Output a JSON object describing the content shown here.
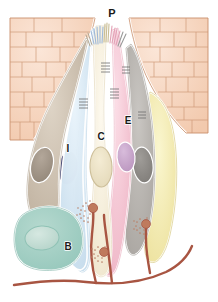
{
  "figure": {
    "background_color": "#ffffff",
    "width": 218,
    "height": 302
  },
  "labels": [
    {
      "id": "P",
      "text": "P",
      "x": 112,
      "y": 17,
      "font_size": 11,
      "meaning": "taste-pore"
    },
    {
      "id": "I",
      "text": "I",
      "x": 68,
      "y": 152,
      "font_size": 10,
      "meaning": "type-I-cell"
    },
    {
      "id": "C",
      "text": "C",
      "x": 101,
      "y": 140,
      "font_size": 10,
      "meaning": "type-II-receptor-cell"
    },
    {
      "id": "E",
      "text": "E",
      "x": 128,
      "y": 124,
      "font_size": 10,
      "meaning": "type-III-presynaptic-cell"
    },
    {
      "id": "B",
      "text": "B",
      "x": 68,
      "y": 250,
      "font_size": 10,
      "meaning": "basal-cell"
    }
  ],
  "palette": {
    "epithelium_fill": "#f6d2bb",
    "epithelium_fill_light": "#fbe4d6",
    "epithelium_stroke": "#c98f6b",
    "outline_white": "#ffffff",
    "cell_tan": "#cfc3b2",
    "cell_tan_dark": "#b7a997",
    "cell_blue": "#d7e7f2",
    "cell_blue_dark": "#bcd6e8",
    "cell_cream": "#f7f1de",
    "cell_cream_dark": "#ece3c9",
    "cell_pink": "#f6ccd7",
    "cell_pink_dark": "#eeb3c4",
    "cell_gray": "#b9b6b2",
    "cell_gray_dark": "#a19d98",
    "cell_yellow": "#f5eeb8",
    "cell_yellow_dark": "#e9dd96",
    "cell_teal": "#9fcdc2",
    "cell_teal_dark": "#8cbfb2",
    "nucleus_tan": "#a39688",
    "nucleus_blue": "#40416b",
    "nucleus_cream": "#ece3c4",
    "nucleus_violet": "#c9a8cc",
    "nucleus_gray": "#8e8b87",
    "nucleus_teal": "#c3dcd3",
    "nerve_fiber": "#a85542",
    "nerve_bouton": "#bf7a5d",
    "junction_line": "#6d6d6d",
    "microvilli_blue": "#9fb8d8",
    "microvilli_pink": "#e2a2b6",
    "microvilli_gray": "#9a9a9a",
    "microvilli_cream": "#d9cfa8",
    "label_color": "#1a1a1a"
  },
  "regions": {
    "epithelium_left": {
      "name": "stratified-squamous-epithelium-left"
    },
    "epithelium_right": {
      "name": "stratified-squamous-epithelium-right"
    },
    "taste_pore": {
      "name": "taste-pore-opening"
    },
    "nerve_plexus": {
      "name": "afferent-nerve-fiber-plexus"
    }
  },
  "cells": [
    {
      "id": "cell-tan-left",
      "label": "",
      "fill": "#cfc3b2",
      "nucleus": "#a39688"
    },
    {
      "id": "cell-blue-I",
      "label": "I",
      "fill": "#d7e7f2",
      "nucleus": "#40416b"
    },
    {
      "id": "cell-cream-C",
      "label": "C",
      "fill": "#f7f1de",
      "nucleus": "#ece3c4"
    },
    {
      "id": "cell-pink-E",
      "label": "E",
      "fill": "#f6ccd7",
      "nucleus": "#c9a8cc"
    },
    {
      "id": "cell-gray-right",
      "label": "",
      "fill": "#b9b6b2",
      "nucleus": "#8e8b87"
    },
    {
      "id": "cell-yellow-right",
      "label": "",
      "fill": "#f5eeb8",
      "nucleus": ""
    },
    {
      "id": "cell-teal-B",
      "label": "B",
      "fill": "#9fcdc2",
      "nucleus": "#c3dcd3"
    }
  ]
}
